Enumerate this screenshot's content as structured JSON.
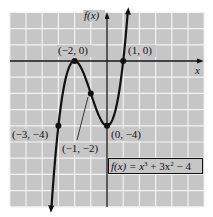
{
  "chart_data": {
    "type": "line",
    "title": "",
    "function": "f(x) = x^3 + 3x^2 - 4",
    "xlabel": "x",
    "ylabel": "f(x)",
    "xlim": [
      -6,
      6
    ],
    "ylim": [
      -9,
      3
    ],
    "grid": true,
    "grid_step": 1,
    "curve_domain": [
      -3.43,
      1.28
    ],
    "points": [
      {
        "x": -3,
        "y": -4,
        "label": "(−3, −4)"
      },
      {
        "x": -2,
        "y": 0,
        "label": "(−2, 0)"
      },
      {
        "x": -1,
        "y": -2,
        "label": "(−1, −2)"
      },
      {
        "x": 0,
        "y": -4,
        "label": "(0, −4)"
      },
      {
        "x": 1,
        "y": 0,
        "label": "(1, 0)"
      }
    ],
    "legend": "f(x) = x³ + 3x² − 4"
  },
  "labels": {
    "y_axis": "f(x)",
    "x_axis": "x",
    "p_m3_m4": "(−3, −4)",
    "p_m2_0": "(−2, 0)",
    "p_m1_m2": "(−1, −2)",
    "p_0_m4": "(0, −4)",
    "p_1_0": "(1, 0)",
    "formula_lhs": "f(x) = x",
    "formula_exp3": "3",
    "formula_mid": " + 3x",
    "formula_exp2": "2",
    "formula_rhs": " − 4"
  },
  "colors": {
    "background": "#c6c6c6",
    "grid": "#f2f2f2",
    "ink": "#111111"
  }
}
